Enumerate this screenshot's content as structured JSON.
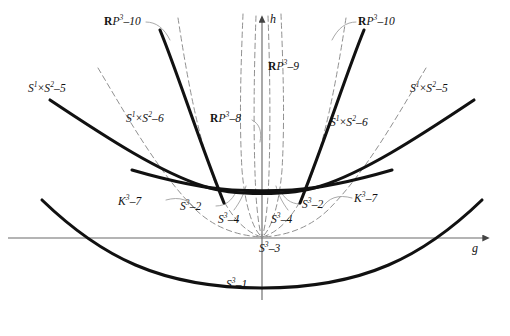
{
  "figure": {
    "type": "bifurcation-diagram",
    "background": "#ffffff",
    "ink": "#111111",
    "axis_color": "#6b6b6b",
    "dash_color": "#8a8a8a",
    "bold_color": "#111111"
  },
  "axes": {
    "h_label": "h",
    "g_label": "g",
    "origin": {
      "x": 262,
      "y": 238
    },
    "h_axis": {
      "x": 262,
      "y_top": 14,
      "y_bottom": 300
    },
    "g_axis": {
      "y": 238,
      "x_left": 8,
      "x_right": 492
    }
  },
  "labels": [
    {
      "name": "rp3-10-left",
      "text": "RP3-10",
      "kind": "rp",
      "num": "10",
      "x": 104,
      "y": 16
    },
    {
      "name": "rp3-10-right",
      "text": "RP3-10",
      "kind": "rp",
      "num": "10",
      "x": 358,
      "y": 16
    },
    {
      "name": "rp3-9",
      "text": "RP3-9",
      "kind": "rp",
      "num": "9",
      "x": 268,
      "y": 61
    },
    {
      "name": "rp3-8",
      "text": "RP3-8",
      "kind": "rp",
      "num": "8",
      "x": 210,
      "y": 113
    },
    {
      "name": "s1s2-5-left",
      "text": "S1xS2-5",
      "kind": "s1s2",
      "num": "5",
      "x": 28,
      "y": 83
    },
    {
      "name": "s1s2-5-right",
      "text": "S1xS2-5",
      "kind": "s1s2",
      "num": "5",
      "x": 410,
      "y": 83
    },
    {
      "name": "s1s2-6-left",
      "text": "S1xS2-6",
      "kind": "s1s2",
      "num": "6",
      "x": 126,
      "y": 113
    },
    {
      "name": "s1s2-6-right",
      "text": "S1xS2-6",
      "kind": "s1s2",
      "num": "6",
      "x": 330,
      "y": 117
    },
    {
      "name": "k3-7-left",
      "text": "K3-7",
      "kind": "k",
      "num": "7",
      "x": 118,
      "y": 196
    },
    {
      "name": "k3-7-right",
      "text": "K3-7",
      "kind": "k",
      "num": "7",
      "x": 354,
      "y": 193
    },
    {
      "name": "s3-2-left",
      "text": "S3-2",
      "kind": "s",
      "num": "2",
      "x": 180,
      "y": 201
    },
    {
      "name": "s3-2-right",
      "text": "S3-2",
      "kind": "s",
      "num": "2",
      "x": 302,
      "y": 199
    },
    {
      "name": "s3-4-left",
      "text": "S3-4",
      "kind": "s",
      "num": "4",
      "x": 218,
      "y": 214
    },
    {
      "name": "s3-4-right",
      "text": "S3-4",
      "kind": "s",
      "num": "4",
      "x": 271,
      "y": 214
    },
    {
      "name": "s3-3",
      "text": "S3-3",
      "kind": "s",
      "num": "3",
      "x": 259,
      "y": 243
    },
    {
      "name": "s3-1",
      "text": "S3-1",
      "kind": "s",
      "num": "1",
      "x": 226,
      "y": 279
    }
  ],
  "curves": {
    "bold": [
      {
        "name": "outer-parabola-s1s2-5",
        "d": "M 50,100 C 110,140 160,172 203,186 C 232,196 292,196 321,186 C 364,172 414,140 474,100"
      },
      {
        "name": "inner-parabola-s3-2",
        "d": "M 132,170 C 170,181 200,188 232,190 C 252,191 272,191 292,190 C 324,188 354,181 392,170"
      },
      {
        "name": "steep-branch-left",
        "d": "M 160,30 C 178,74 198,138 224,203"
      },
      {
        "name": "steep-branch-right",
        "d": "M 364,30 C 346,74 326,138 300,203"
      },
      {
        "name": "bottom-parabola-s3-1",
        "d": "M 42,200 C 100,256 160,288 262,288 C 364,288 424,256 482,200"
      }
    ],
    "dashed": [
      {
        "name": "dash-outer-left",
        "d": "M 98,68 C 128,118 158,172 196,210 C 216,229 240,236 262,237"
      },
      {
        "name": "dash-outer-right",
        "d": "M 426,68 C 396,118 366,172 328,210 C 308,229 284,236 262,237"
      },
      {
        "name": "dash-mid-left",
        "d": "M 178,18 C 186,70 196,130 214,180 C 228,216 246,233 262,237"
      },
      {
        "name": "dash-mid-right",
        "d": "M 346,18 C 338,70 328,130 310,180 C 296,216 278,233 262,237"
      },
      {
        "name": "dash-inner-left",
        "d": "M 243,14 C 241,64 239,120 242,170 C 245,206 253,230 262,237"
      },
      {
        "name": "dash-inner-right",
        "d": "M 281,14 C 283,64 285,120 282,170 C 279,206 271,230 262,237"
      },
      {
        "name": "dash-core-left",
        "d": "M 256,16 C 254,70 253,140 256,196 C 258,222 260,232 262,237"
      },
      {
        "name": "dash-core-right",
        "d": "M 268,16 C 270,70 271,140 268,196 C 266,222 264,232 262,237"
      }
    ],
    "leaders": [
      {
        "name": "leader-rp3-10-left",
        "d": "M 146,22 C 156,22 164,28 170,40"
      },
      {
        "name": "leader-rp3-10-right",
        "d": "M 356,22 C 346,22 338,28 332,40"
      },
      {
        "name": "leader-rp3-8",
        "d": "M 252,120 C 260,124 262,132 260,142"
      },
      {
        "name": "leader-k3-7-left",
        "d": "M 166,200 C 180,196 190,200 196,210"
      },
      {
        "name": "leader-k3-7-right",
        "d": "M 352,198 C 338,194 328,198 322,208"
      },
      {
        "name": "leader-s3-2-left",
        "d": "M 216,206 C 226,206 232,200 236,192"
      },
      {
        "name": "leader-s3-2-right",
        "d": "M 300,204 C 290,204 284,198 280,190"
      },
      {
        "name": "leader-s3-4-left",
        "d": "M 234,210 C 240,202 244,194 246,186"
      },
      {
        "name": "leader-s3-4-right",
        "d": "M 288,210 C 282,202 278,194 276,186"
      }
    ]
  }
}
